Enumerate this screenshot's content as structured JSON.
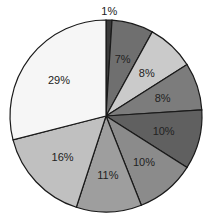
{
  "chart_data": {
    "type": "pie",
    "title": "",
    "title_visible": "partially cut off at top",
    "start_angle_deg": 0,
    "direction": "clockwise",
    "slices": [
      {
        "label": "1%",
        "value": 1,
        "color": "#3a3a3a"
      },
      {
        "label": "7%",
        "value": 7,
        "color": "#6f6f6f"
      },
      {
        "label": "8%",
        "value": 8,
        "color": "#cacaca"
      },
      {
        "label": "8%",
        "value": 8,
        "color": "#7c7c7c"
      },
      {
        "label": "10%",
        "value": 10,
        "color": "#606060"
      },
      {
        "label": "10%",
        "value": 10,
        "color": "#8b8b8b"
      },
      {
        "label": "11%",
        "value": 11,
        "color": "#9e9e9e"
      },
      {
        "label": "16%",
        "value": 16,
        "color": "#c0c0c0"
      },
      {
        "label": "29%",
        "value": 29,
        "color": "#f6f6f6"
      }
    ],
    "center": [
      106,
      116
    ],
    "radius": 96
  }
}
